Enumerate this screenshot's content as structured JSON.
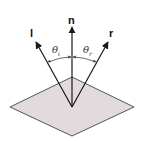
{
  "diagram": {
    "colors": {
      "background": "#ffffff",
      "plane_fill": "#e3dadd",
      "plane_stroke": "#555555",
      "vector_stroke": "#1a1a1a",
      "arc_stroke": "#444444"
    },
    "plane": {
      "shape": "diamond",
      "vertices": {
        "top": [
          72,
          77
        ],
        "right": [
          134,
          107
        ],
        "bottom": [
          72,
          136
        ],
        "left": [
          10,
          107
        ]
      }
    },
    "origin": [
      72,
      107
    ],
    "vectors": [
      {
        "id": "l",
        "label": "l",
        "meaning": "light direction",
        "tip": [
          36,
          42
        ],
        "label_pos": [
          30,
          36
        ]
      },
      {
        "id": "n",
        "label": "n",
        "meaning": "surface normal",
        "tip": [
          72,
          27
        ],
        "label_pos": [
          68,
          23
        ]
      },
      {
        "id": "r",
        "label": "r",
        "meaning": "reflection direction",
        "tip": [
          108,
          42
        ],
        "label_pos": [
          110,
          36
        ]
      }
    ],
    "angles": [
      {
        "id": "theta_i",
        "symbol": "θ",
        "subscript": "i",
        "between": [
          "l",
          "n"
        ],
        "label_pos": [
          53,
          52
        ]
      },
      {
        "id": "theta_r",
        "symbol": "θ",
        "subscript": "r",
        "between": [
          "n",
          "r"
        ],
        "label_pos": [
          84,
          52
        ]
      }
    ],
    "labels": {
      "l": "l",
      "n": "n",
      "r": "r",
      "theta": "θ",
      "sub_i": "i",
      "sub_r": "r"
    }
  }
}
